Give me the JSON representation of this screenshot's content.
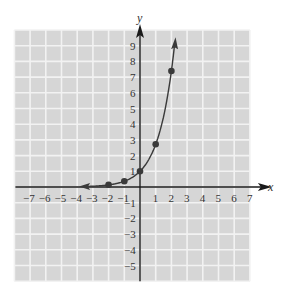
{
  "chart_data": {
    "type": "line",
    "title": "",
    "xlabel": "x",
    "ylabel": "y",
    "xlim": [
      -8,
      7
    ],
    "ylim": [
      -6,
      10
    ],
    "grid": true,
    "x_ticks": [
      -7,
      -6,
      -5,
      -4,
      -3,
      -2,
      -1,
      1,
      2,
      3,
      4,
      5,
      6,
      7
    ],
    "y_ticks": [
      -5,
      -4,
      -3,
      -2,
      -1,
      1,
      2,
      3,
      4,
      5,
      6,
      7,
      8,
      9
    ],
    "x_tick_labels": [
      "−7",
      "−6",
      "−5",
      "−4",
      "−3",
      "−2",
      "−1",
      "1",
      "2",
      "3",
      "4",
      "5",
      "6",
      "7"
    ],
    "y_tick_labels": [
      "−5",
      "−4",
      "−3",
      "−2",
      "−1",
      "1",
      "2",
      "3",
      "4",
      "5",
      "6",
      "7",
      "8",
      "9"
    ],
    "series": [
      {
        "name": "y = e^x",
        "curve": "exponential",
        "points": [
          {
            "x": -2,
            "y": 0.14
          },
          {
            "x": -1,
            "y": 0.37
          },
          {
            "x": 0,
            "y": 1
          },
          {
            "x": 1,
            "y": 2.72
          },
          {
            "x": 2,
            "y": 7.39
          }
        ],
        "arrow_left_end": {
          "x": -3.5,
          "y": 0.03
        },
        "arrow_right_end": {
          "x": 2.2,
          "y": 9.1
        }
      }
    ],
    "colors": {
      "grid_background": "#d6d6d6",
      "grid_lines": "#f2f2f2",
      "axes": "#1a1a1a",
      "curve": "#3a3a3a",
      "points": "#3a3a3a"
    }
  }
}
